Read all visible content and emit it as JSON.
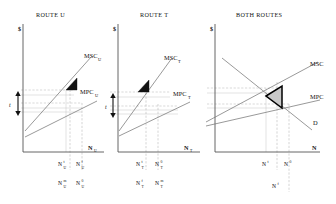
{
  "figure": {
    "caption": "Externality and congestion diagrams for two routes and combined routes",
    "background": "#ffffff",
    "curve_color": "#777777",
    "axis_color": "#555555",
    "dwl_dark_color": "#121212",
    "dwl_grey_fill": "#c9c9c9",
    "dwl_grey_stroke": "#000000",
    "guide_color": "#b0b0b0"
  },
  "panels": [
    {
      "id": "route-u",
      "title": "ROUTE U",
      "y_axis_label": "$",
      "x_axis_label": "N",
      "x_axis_sub": "U",
      "tax_label": "t",
      "curves": [
        {
          "name": "MSC",
          "sub": "U",
          "label": "MSC",
          "sublabel": "U"
        },
        {
          "name": "MPC",
          "sub": "U",
          "label": "MPC",
          "sublabel": "U"
        }
      ],
      "ticks_upper": [
        {
          "base": "N",
          "sub": "U",
          "sup": "t"
        },
        {
          "base": "N",
          "sub": "U",
          "sup": "f"
        }
      ],
      "ticks_lower": [
        {
          "base": "N",
          "sub": "U",
          "sup": "m"
        },
        {
          "base": "N",
          "sub": "U",
          "sup": "0"
        }
      ]
    },
    {
      "id": "route-t",
      "title": "ROUTE T",
      "y_axis_label": "$",
      "x_axis_label": "N",
      "x_axis_sub": "T",
      "tax_label": "t",
      "curves": [
        {
          "name": "MSC",
          "sub": "T",
          "label": "MSC",
          "sublabel": "T"
        },
        {
          "name": "MPC",
          "sub": "T",
          "label": "MPC",
          "sublabel": "T"
        }
      ],
      "ticks_upper": [
        {
          "base": "N",
          "sub": "T",
          "sup": "t"
        },
        {
          "base": "N",
          "sub": "T",
          "sup": "0"
        }
      ],
      "ticks_lower": [
        {
          "base": "N",
          "sub": "T",
          "sup": "f"
        },
        {
          "base": "N",
          "sub": "T",
          "sup": "m"
        }
      ]
    },
    {
      "id": "both-routes",
      "title": "BOTH ROUTES",
      "y_axis_label": "$",
      "x_axis_label": "N",
      "x_axis_sub": "",
      "tax_label": "",
      "curves": [
        {
          "name": "MSC",
          "sub": "",
          "label": "MSC",
          "sublabel": ""
        },
        {
          "name": "MPC",
          "sub": "",
          "label": "MPC",
          "sublabel": ""
        },
        {
          "name": "D",
          "sub": "",
          "label": "D",
          "sublabel": ""
        }
      ],
      "ticks_upper": [
        {
          "base": "N",
          "sub": "",
          "sup": "t"
        },
        {
          "base": "N",
          "sub": "",
          "sup": "0"
        }
      ],
      "ticks_lower": [
        {
          "base": "N",
          "sub": "",
          "sup": "f"
        }
      ]
    }
  ]
}
